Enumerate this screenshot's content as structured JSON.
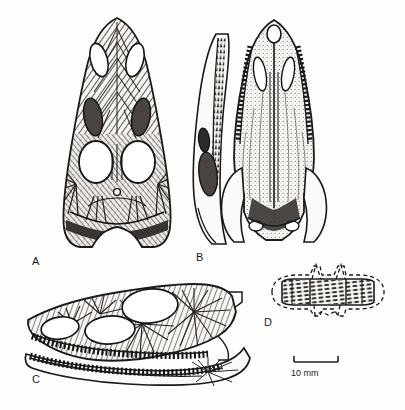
{
  "figure": {
    "kind": "scientific-illustration",
    "technique": "pen-and-ink stipple and hatch drawing",
    "background_color": "#fdfdfc",
    "ink_color": "#1a1a1a",
    "panel_count": 4
  },
  "panels": [
    {
      "id": "A",
      "label": "A",
      "view": "skull in dorsal view",
      "features": [
        "external nares",
        "antorbital fenestrae",
        "orbits",
        "pineal foramen",
        "supratemporal fenestrae",
        "sculptured dermal bone"
      ]
    },
    {
      "id": "B",
      "label": "B",
      "view": "skull in palatal (ventral) view with lower jaw alongside",
      "features": [
        "internal naris",
        "tooth rows",
        "palatine",
        "pterygoid",
        "basicranium",
        "quadrate condyles"
      ]
    },
    {
      "id": "C",
      "label": "C",
      "view": "skull and mandible in lateral view",
      "features": [
        "external naris",
        "antorbital fenestra",
        "orbit",
        "maxillary tooth row",
        "dentary tooth row",
        "radiating bone ornamentation"
      ]
    },
    {
      "id": "D",
      "label": "D",
      "view": "dorsal osteoderm / vertebra in dorsal view with reconstructed outline",
      "features": [
        "paired dorsal spines",
        "dashed reconstruction outline",
        "ridged ornamentation"
      ]
    }
  ],
  "scale_bar": {
    "label": "10 mm",
    "value": 10,
    "unit": "mm",
    "style": "I-beam with end ticks"
  },
  "labels": {
    "a": "A",
    "b": "B",
    "c": "C",
    "d": "D"
  }
}
